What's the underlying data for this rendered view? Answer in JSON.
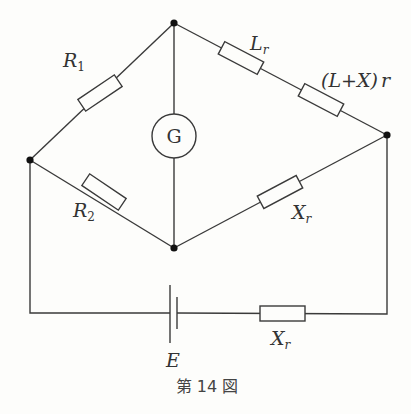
{
  "figure": {
    "caption": "第 14 図",
    "nodes": [
      {
        "id": "top",
        "x": 174,
        "y": 23
      },
      {
        "id": "left",
        "x": 30,
        "y": 160
      },
      {
        "id": "right",
        "x": 387,
        "y": 135
      },
      {
        "id": "bottom",
        "x": 174,
        "y": 248
      }
    ],
    "components": {
      "r1": {
        "symbol": "R",
        "subscript": "1",
        "type": "resistor",
        "between": [
          "left",
          "top"
        ]
      },
      "r2": {
        "symbol": "R",
        "subscript": "2",
        "type": "resistor",
        "between": [
          "left",
          "bottom"
        ]
      },
      "lr": {
        "symbol": "L",
        "subscript": "r",
        "type": "resistor",
        "between": [
          "top",
          "right"
        ]
      },
      "lxr": {
        "text": "(L+X)",
        "suffix": "r",
        "type": "resistor",
        "between": [
          "top",
          "right"
        ]
      },
      "xr_bridge": {
        "symbol": "X",
        "subscript": "r",
        "type": "resistor",
        "between": [
          "bottom",
          "right"
        ]
      },
      "galvanometer": {
        "symbol": "G",
        "type": "galvanometer",
        "between": [
          "top",
          "bottom"
        ]
      },
      "battery": {
        "symbol": "E",
        "type": "battery"
      },
      "xr_supply": {
        "symbol": "X",
        "subscript": "r",
        "type": "resistor"
      }
    }
  }
}
